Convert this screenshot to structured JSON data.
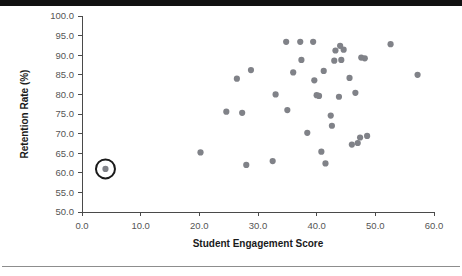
{
  "figure": {
    "background_color": "#ffffff",
    "top_bar_color": "#111111",
    "bottom_rule_color": "#8d8d8d"
  },
  "chart_data": {
    "type": "scatter",
    "title": "",
    "xlabel": "Student Engagement Score",
    "ylabel": "Retention Rate (%)",
    "xlim": [
      0.0,
      60.0
    ],
    "ylim": [
      50.0,
      100.0
    ],
    "xticks": [
      "0.0",
      "10.0",
      "20.0",
      "30.0",
      "40.0",
      "50.0",
      "60.0"
    ],
    "xtick_values": [
      0.0,
      10.0,
      20.0,
      30.0,
      40.0,
      50.0,
      60.0
    ],
    "yticks": [
      "50.0",
      "55.0",
      "60.0",
      "65.0",
      "70.0",
      "75.0",
      "80.0",
      "85.0",
      "90.0",
      "95.0",
      "100.0"
    ],
    "ytick_values": [
      50.0,
      55.0,
      60.0,
      65.0,
      70.0,
      75.0,
      80.0,
      85.0,
      90.0,
      95.0,
      100.0
    ],
    "grid": false,
    "legend": null,
    "marker_color": "#808288",
    "marker_radius_px": 3.1,
    "highlight_color": "#1a1a1a",
    "highlight_radius_px": 9.5,
    "points": [
      {
        "x": 4.0,
        "y": 61.0,
        "highlighted": true
      },
      {
        "x": 20.2,
        "y": 65.2,
        "highlighted": false
      },
      {
        "x": 24.6,
        "y": 75.6,
        "highlighted": false
      },
      {
        "x": 26.4,
        "y": 84.0,
        "highlighted": false
      },
      {
        "x": 27.3,
        "y": 75.3,
        "highlighted": false
      },
      {
        "x": 28.0,
        "y": 62.0,
        "highlighted": false
      },
      {
        "x": 28.8,
        "y": 86.2,
        "highlighted": false
      },
      {
        "x": 32.5,
        "y": 63.0,
        "highlighted": false
      },
      {
        "x": 33.0,
        "y": 80.0,
        "highlighted": false
      },
      {
        "x": 34.8,
        "y": 93.4,
        "highlighted": false
      },
      {
        "x": 35.0,
        "y": 76.0,
        "highlighted": false
      },
      {
        "x": 36.0,
        "y": 85.6,
        "highlighted": false
      },
      {
        "x": 37.2,
        "y": 93.4,
        "highlighted": false
      },
      {
        "x": 37.4,
        "y": 88.8,
        "highlighted": false
      },
      {
        "x": 38.4,
        "y": 70.2,
        "highlighted": false
      },
      {
        "x": 39.4,
        "y": 93.4,
        "highlighted": false
      },
      {
        "x": 39.6,
        "y": 83.6,
        "highlighted": false
      },
      {
        "x": 40.0,
        "y": 79.8,
        "highlighted": false
      },
      {
        "x": 40.4,
        "y": 79.6,
        "highlighted": false
      },
      {
        "x": 40.8,
        "y": 65.4,
        "highlighted": false
      },
      {
        "x": 41.2,
        "y": 86.0,
        "highlighted": false
      },
      {
        "x": 41.5,
        "y": 62.4,
        "highlighted": false
      },
      {
        "x": 42.4,
        "y": 74.6,
        "highlighted": false
      },
      {
        "x": 42.6,
        "y": 72.0,
        "highlighted": false
      },
      {
        "x": 43.0,
        "y": 88.6,
        "highlighted": false
      },
      {
        "x": 43.2,
        "y": 91.2,
        "highlighted": false
      },
      {
        "x": 43.8,
        "y": 79.4,
        "highlighted": false
      },
      {
        "x": 44.0,
        "y": 92.4,
        "highlighted": false
      },
      {
        "x": 44.2,
        "y": 88.8,
        "highlighted": false
      },
      {
        "x": 44.6,
        "y": 91.4,
        "highlighted": false
      },
      {
        "x": 45.6,
        "y": 84.2,
        "highlighted": false
      },
      {
        "x": 46.0,
        "y": 67.2,
        "highlighted": false
      },
      {
        "x": 46.6,
        "y": 80.4,
        "highlighted": false
      },
      {
        "x": 47.0,
        "y": 67.6,
        "highlighted": false
      },
      {
        "x": 47.4,
        "y": 69.0,
        "highlighted": false
      },
      {
        "x": 47.6,
        "y": 89.4,
        "highlighted": false
      },
      {
        "x": 48.2,
        "y": 89.2,
        "highlighted": false
      },
      {
        "x": 48.6,
        "y": 69.4,
        "highlighted": false
      },
      {
        "x": 52.6,
        "y": 92.8,
        "highlighted": false
      },
      {
        "x": 57.2,
        "y": 85.0,
        "highlighted": false
      }
    ]
  }
}
